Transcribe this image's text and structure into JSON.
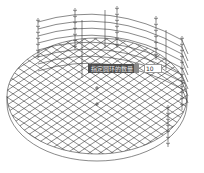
{
  "viewport": {
    "background": "#ffffff",
    "line_color": "#3a3a3a"
  },
  "model": {
    "type": "circular-mesh-with-rings",
    "plate": {
      "cx": 97,
      "cy": 96,
      "rx": 90,
      "ry": 58,
      "thickness": 7
    },
    "rings": {
      "count_visible": 8
    },
    "grid": {
      "pattern": "diagonal-diamond",
      "spacing": 11
    },
    "center_markers": [
      {
        "x": 97,
        "y": 88
      },
      {
        "x": 97,
        "y": 104
      }
    ]
  },
  "prompt": {
    "label": "指定圆环的数量",
    "value": "10",
    "label_bg": "#4d4d4d"
  }
}
